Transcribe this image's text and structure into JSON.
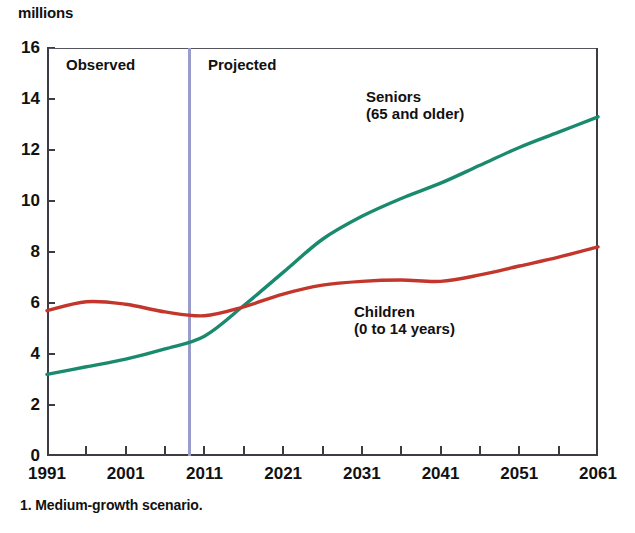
{
  "unit_label": "millions",
  "footnote": "1. Medium-growth scenario.",
  "annotations": {
    "observed": "Observed",
    "projected": "Projected",
    "seniors_line1": "Seniors",
    "seniors_line2": "(65 and older)",
    "children_line1": "Children",
    "children_line2": "(0 to 14 years)"
  },
  "colors": {
    "seniors": "#1a8a6e",
    "children": "#c3362c",
    "divider": "#9a9ccb",
    "axis": "#3c3c44",
    "text": "#111111",
    "background": "#ffffff"
  },
  "chart_data": {
    "type": "line",
    "title": "",
    "subtitle": "",
    "xlabel": "",
    "ylabel": "millions",
    "xlim": [
      1991,
      2061
    ],
    "ylim": [
      0,
      16
    ],
    "grid": false,
    "legend_position": "inline-labels",
    "y_ticks": [
      0,
      2,
      4,
      6,
      8,
      10,
      12,
      14,
      16
    ],
    "x_ticks": [
      1991,
      2001,
      2011,
      2021,
      2031,
      2041,
      2051,
      2061
    ],
    "x_minor_ticks": [
      1996,
      2006,
      2016,
      2026,
      2036,
      2046,
      2056
    ],
    "divider_x": 2009,
    "annotations": [
      {
        "text": "Observed",
        "x": 1994,
        "y": 15.2
      },
      {
        "text": "Projected",
        "x": 2012,
        "y": 15.2
      },
      {
        "text": "Seniors (65 and older)",
        "x": 2030,
        "y": 13.4
      },
      {
        "text": "Children (0 to 14 years)",
        "x": 2029,
        "y": 5.2
      }
    ],
    "series": [
      {
        "name": "Seniors (65 and older)",
        "color": "#1a8a6e",
        "x": [
          1991,
          1996,
          2001,
          2006,
          2011,
          2016,
          2021,
          2026,
          2031,
          2036,
          2041,
          2046,
          2051,
          2056,
          2061
        ],
        "values": [
          3.2,
          3.5,
          3.8,
          4.2,
          4.7,
          5.9,
          7.2,
          8.5,
          9.4,
          10.1,
          10.7,
          11.4,
          12.1,
          12.7,
          13.3
        ]
      },
      {
        "name": "Children (0 to 14 years)",
        "color": "#c3362c",
        "x": [
          1991,
          1996,
          2001,
          2006,
          2011,
          2016,
          2021,
          2026,
          2031,
          2036,
          2041,
          2046,
          2051,
          2056,
          2061
        ],
        "values": [
          5.7,
          6.05,
          5.95,
          5.65,
          5.5,
          5.85,
          6.35,
          6.7,
          6.85,
          6.9,
          6.85,
          7.1,
          7.45,
          7.8,
          8.2
        ]
      }
    ]
  }
}
